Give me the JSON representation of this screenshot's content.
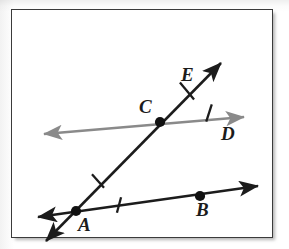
{
  "figure": {
    "kind": "geometry-diagram",
    "background_color": "#ffffff",
    "frame_color": "#3b3b3b",
    "stroke_black": "#1c1c1c",
    "stroke_gray": "#8a8a8a"
  },
  "labels": {
    "A": "A",
    "B": "B",
    "C": "C",
    "D": "D",
    "E": "E"
  },
  "points": [
    {
      "name": "A",
      "x": 76,
      "y": 211,
      "filled": true
    },
    {
      "name": "B",
      "x": 200,
      "y": 196,
      "filled": true
    },
    {
      "name": "C",
      "x": 160,
      "y": 122,
      "filled": true
    }
  ],
  "lines": [
    {
      "name": "line-AB",
      "color": "#1c1c1c",
      "from": {
        "x": 38,
        "y": 217
      },
      "to": {
        "x": 258,
        "y": 186
      },
      "arrow_start": true,
      "arrow_end": true
    },
    {
      "name": "line-AE",
      "color": "#1c1c1c",
      "from": {
        "x": 46,
        "y": 241
      },
      "to": {
        "x": 221,
        "y": 63
      },
      "arrow_start": true,
      "arrow_end": true
    },
    {
      "name": "line-CD",
      "color": "#8a8a8a",
      "from": {
        "x": 44,
        "y": 134
      },
      "to": {
        "x": 244,
        "y": 117
      },
      "arrow_start": true,
      "arrow_end": true
    }
  ],
  "tick_marks": [
    {
      "name": "tick-on-AC",
      "x": 98,
      "y": 181,
      "angle": 48
    },
    {
      "name": "tick-on-AB",
      "x": 119,
      "y": 205,
      "angle": 105
    },
    {
      "name": "tick-on-CE",
      "x": 187,
      "y": 91,
      "angle": 50
    },
    {
      "name": "tick-on-CD",
      "x": 209,
      "y": 113,
      "angle": 108
    }
  ]
}
